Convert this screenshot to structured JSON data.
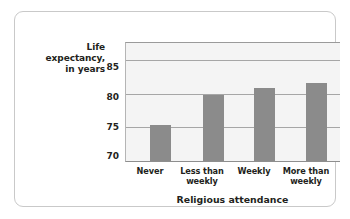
{
  "chart_data": {
    "type": "bar",
    "title": "",
    "categories": [
      "Never",
      "Less than weekly",
      "Weekly",
      "More than weekly"
    ],
    "category_lines": [
      [
        "Never"
      ],
      [
        "Less than",
        "weekly"
      ],
      [
        "Weekly"
      ],
      [
        "More than",
        "weekly"
      ]
    ],
    "values": [
      75.3,
      79.8,
      80.9,
      81.5
    ],
    "xlabel": "Religious attendance",
    "ylabel": "Life expectancy, in years",
    "ylabel_lines": [
      "Life",
      "expectancy,",
      "in years"
    ],
    "yticks": [
      70,
      75,
      80,
      85
    ],
    "ylim": [
      70,
      87.5
    ],
    "grid": true,
    "legend": "none",
    "bar_color": "#8b8b8b",
    "plot_background": "#f4f4f4",
    "gridline_color": "#a6a6a6",
    "frame_color": "#c9c9c9"
  }
}
